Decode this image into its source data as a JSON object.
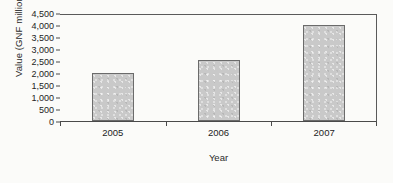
{
  "chart_data": {
    "type": "bar",
    "title": "",
    "xlabel": "Year",
    "ylabel": "Value (GNF million)",
    "categories": [
      "2005",
      "2006",
      "2007"
    ],
    "values": [
      2000,
      2530,
      4000
    ],
    "series": [
      {
        "name": "Value (GNF million)",
        "values": [
          2000,
          2530,
          4000
        ]
      }
    ],
    "ylim": [
      0,
      4500
    ],
    "ytick_interval": 500,
    "ytick_labels": [
      "0",
      "500",
      "1,000",
      "1,500",
      "2,000",
      "2,500",
      "3,000",
      "3,500",
      "4,000",
      "4,500"
    ],
    "ytick_values": [
      0,
      500,
      1000,
      1500,
      2000,
      2500,
      3000,
      3500,
      4000,
      4500
    ],
    "grid": false,
    "legend": false,
    "legend_position": "none",
    "bar_fill_color": "#c9c9c9",
    "bar_border_color": "#6b6b6b",
    "axis_color": "#4a4a4a",
    "background_color": "#fbfbf9",
    "text_color": "#232323"
  }
}
